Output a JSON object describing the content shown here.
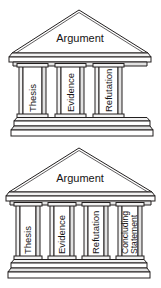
{
  "diagram": {
    "line_color": "#221f1f",
    "background_color": "#ffffff",
    "shade_color": "#e2e2e2",
    "temples": [
      {
        "id": "three-column-temple",
        "pediment_label": "Argument",
        "column_count": 3,
        "columns": [
          {
            "label": "Thesis",
            "line2": ""
          },
          {
            "label": "Evidence",
            "line2": ""
          },
          {
            "label": "Refutation",
            "line2": ""
          }
        ]
      },
      {
        "id": "four-column-temple",
        "pediment_label": "Argument",
        "column_count": 4,
        "columns": [
          {
            "label": "Thesis",
            "line2": ""
          },
          {
            "label": "Evidence",
            "line2": ""
          },
          {
            "label": "Refutation",
            "line2": ""
          },
          {
            "label": "Concluding",
            "line2": "Statement"
          }
        ]
      }
    ]
  }
}
